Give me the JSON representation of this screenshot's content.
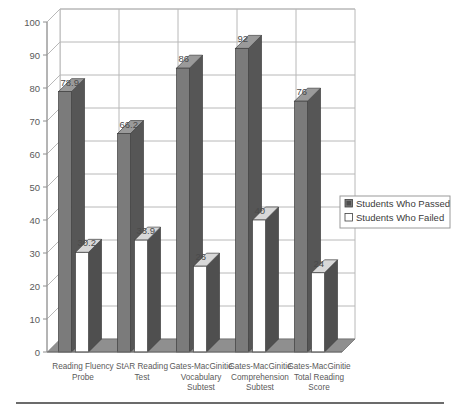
{
  "chart_data": {
    "type": "bar",
    "title": "",
    "xlabel": "",
    "ylabel": "",
    "ylim": [
      0,
      100
    ],
    "ytick_step": 10,
    "yticks": [
      "0",
      "10",
      "20",
      "30",
      "40",
      "50",
      "60",
      "70",
      "80",
      "90",
      "100"
    ],
    "grid": "horizontal-and-vertical",
    "legend_position": "right",
    "style": "3d-clustered-column",
    "categories": [
      "Reading Fluency Probe",
      "StAR Reading Test",
      "Gates-MacGinitie Vocabulary Subtest",
      "Gates-MacGinitie Comprehension Subtest",
      "Gates-MacGinitie Total Reading Score"
    ],
    "category_lines": [
      [
        "Reading Fluency",
        "Probe"
      ],
      [
        "StAR Reading",
        "Test"
      ],
      [
        "Gates-MacGinitie",
        "Vocabulary",
        "Subtest"
      ],
      [
        "Gates-MacGinitie",
        "Comprehension",
        "Subtest"
      ],
      [
        "Gates-MacGinitie",
        "Total Reading",
        "Score"
      ]
    ],
    "series": [
      {
        "name": "Students Who Passed",
        "color": "#7b7b7b",
        "values": [
          78.9,
          66.2,
          86,
          92,
          76
        ],
        "labels": [
          "78.9",
          "66.2",
          "86",
          "92",
          "76"
        ]
      },
      {
        "name": "Students Who Failed",
        "color": "#ffffff",
        "values": [
          30.2,
          33.9,
          26,
          40,
          24
        ],
        "labels": [
          "30.2",
          "33.9",
          "26",
          "40",
          "24"
        ]
      }
    ]
  },
  "legend": {
    "items": [
      {
        "label": "Students Who Passed",
        "swatch": "filled"
      },
      {
        "label": "Students Who Failed",
        "swatch": "empty"
      }
    ]
  },
  "colors": {
    "bar_passed_front": "#7b7b7b",
    "bar_passed_side": "#565656",
    "bar_passed_top": "#9a9a9a",
    "bar_failed_front": "#ffffff",
    "bar_failed_side": "#4f4f4f",
    "bar_failed_top": "#d8d8d8",
    "grid": "#b8b8b8",
    "axis": "#8e8e8e",
    "floor": "#8a8a8a",
    "text": "#5a5a5a",
    "rule": "#3a3a3a"
  }
}
